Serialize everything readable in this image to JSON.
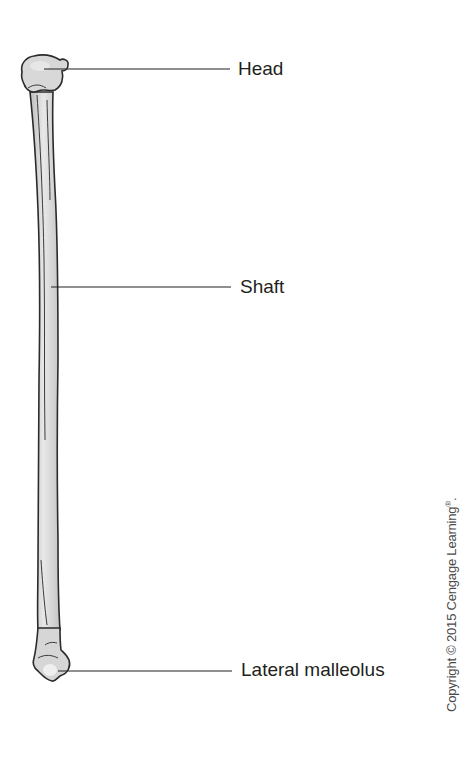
{
  "figure": {
    "labels": [
      {
        "id": "head",
        "text": "Head"
      },
      {
        "id": "shaft",
        "text": "Shaft"
      },
      {
        "id": "lateral_malleolus",
        "text": "Lateral malleolus"
      }
    ],
    "copyright": {
      "text": "Copyright © 2015 Cengage Learning",
      "mark": "®",
      "suffix": "."
    },
    "colors": {
      "bone_fill": "#d4d4d4",
      "bone_highlight": "#ececec",
      "outline": "#2b2b2b",
      "leader_line": "#231f20",
      "text": "#231f20"
    }
  }
}
